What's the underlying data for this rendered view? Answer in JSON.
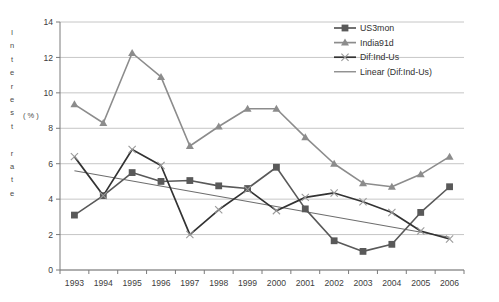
{
  "chart_data": {
    "type": "line",
    "title": "",
    "xlabel": "",
    "ylabel": "Interest rate (%)",
    "ylabel_letters": [
      "I",
      "n",
      "t",
      "e",
      "r",
      "e",
      "s",
      "t",
      "",
      "r",
      "a",
      "t",
      "e"
    ],
    "ylabel_unit": "( % )",
    "grid": true,
    "legend_position": "top-right",
    "xlim": [
      1993,
      2006
    ],
    "ylim": [
      0,
      14
    ],
    "ytick_step": 2,
    "categories": [
      1993,
      1994,
      1995,
      1996,
      1997,
      1998,
      1999,
      2000,
      2001,
      2002,
      2003,
      2004,
      2005,
      2006
    ],
    "xticks": [
      "1993",
      "1994",
      "1995",
      "1996",
      "1997",
      "1998",
      "1999",
      "2000",
      "2001",
      "2002",
      "2003",
      "2004",
      "2005",
      "2006"
    ],
    "yticks": [
      "0",
      "2",
      "4",
      "6",
      "8",
      "10",
      "12",
      "14"
    ],
    "series": [
      {
        "name": "US3mon",
        "marker": "square",
        "color": "#595959",
        "values": [
          3.1,
          4.2,
          5.5,
          5.0,
          5.05,
          4.75,
          4.6,
          5.8,
          3.45,
          1.65,
          1.05,
          1.45,
          3.25,
          4.7
        ]
      },
      {
        "name": "India91d",
        "marker": "triangle",
        "color": "#8c8c8c",
        "values": [
          9.35,
          8.3,
          12.25,
          10.9,
          7.0,
          8.1,
          9.1,
          9.1,
          7.5,
          6.0,
          4.9,
          4.7,
          5.4,
          6.4
        ]
      },
      {
        "name": "Dif:Ind-Us",
        "marker": "x",
        "color": "#333333",
        "values": [
          6.4,
          4.2,
          6.8,
          5.9,
          2.0,
          3.4,
          4.55,
          3.35,
          4.1,
          4.35,
          3.85,
          3.25,
          2.2,
          1.75
        ]
      }
    ],
    "trendline": {
      "name": "Linear (Dif:Ind-Us)",
      "color": "#6e6e6e",
      "x_start": 1993,
      "y_start": 5.6,
      "x_end": 2006,
      "y_end": 1.85
    },
    "legend_entries": [
      {
        "label": "US3mon",
        "marker": "square",
        "color": "#595959"
      },
      {
        "label": "India91d",
        "marker": "triangle",
        "color": "#8c8c8c"
      },
      {
        "label": "Dif:Ind-Us",
        "marker": "x",
        "color": "#333333"
      },
      {
        "label": "Linear (Dif:Ind-Us)",
        "marker": "line",
        "color": "#6e6e6e"
      }
    ]
  }
}
